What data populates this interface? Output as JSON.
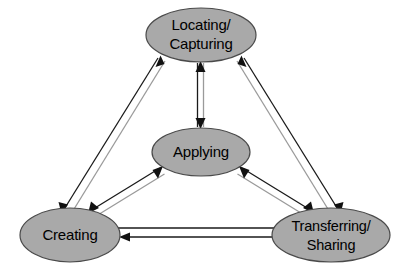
{
  "diagram": {
    "type": "cycle-flow-diagram",
    "background_color": "#ffffff",
    "node_fill_color": "#a9a9a9",
    "node_stroke_color": "#4a4a4a",
    "arrow_color": "#111111",
    "label_color": "#000000",
    "nodes": [
      {
        "id": "locating-capturing",
        "label_line1": "Locating/",
        "label_line2": "Capturing",
        "cx": 201,
        "cy": 35,
        "rx": 55,
        "ry": 27
      },
      {
        "id": "applying",
        "label_line1": "Applying",
        "label_line2": "",
        "cx": 201,
        "cy": 152,
        "rx": 49,
        "ry": 24
      },
      {
        "id": "creating",
        "label_line1": "Creating",
        "label_line2": "",
        "cx": 70,
        "cy": 235,
        "rx": 50,
        "ry": 27
      },
      {
        "id": "transferring-sharing",
        "label_line1": "Transferring/",
        "label_line2": "Sharing",
        "cx": 331,
        "cy": 235,
        "rx": 59,
        "ry": 27
      }
    ],
    "connections": [
      {
        "id": "locating-applying",
        "from": "locating-capturing",
        "to": "applying",
        "bidirectional": true
      },
      {
        "id": "creating-locating",
        "from": "creating",
        "to": "locating-capturing",
        "bidirectional": true
      },
      {
        "id": "creating-applying",
        "from": "creating",
        "to": "applying",
        "bidirectional": true
      },
      {
        "id": "transferring-locating",
        "from": "transferring-sharing",
        "to": "locating-capturing",
        "bidirectional": true
      },
      {
        "id": "transferring-applying",
        "from": "transferring-sharing",
        "to": "applying",
        "bidirectional": true
      },
      {
        "id": "creating-to-transferring",
        "from": "creating",
        "to": "transferring-sharing",
        "bidirectional": false
      },
      {
        "id": "transferring-to-creating",
        "from": "transferring-sharing",
        "to": "creating",
        "bidirectional": false
      }
    ]
  }
}
